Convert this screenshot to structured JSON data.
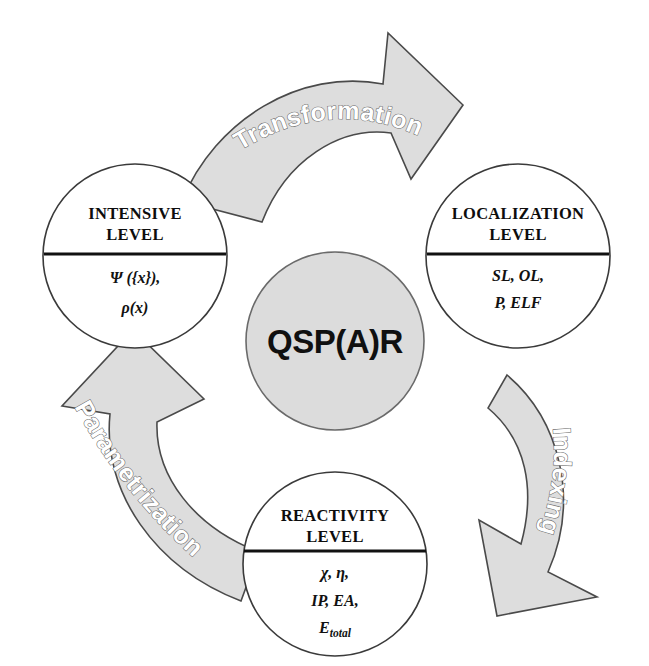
{
  "diagram": {
    "center": {
      "label": "QSP(A)R",
      "fill_color": "#dcdcdc",
      "stroke_color": "#6a6a6a"
    },
    "colors": {
      "arrow_fill": "#dddddd",
      "arrow_stroke": "#4a4a4a",
      "circle_fill": "#ffffff",
      "circle_stroke": "#3a3a3a",
      "text": "#101010",
      "label_outline": "#ffffff"
    },
    "nodes": [
      {
        "id": "intensive",
        "title_line1": "INTENSIVE",
        "title_line2": "LEVEL",
        "formula_lines": [
          "Ψ ({x}),",
          "ρ(x)"
        ]
      },
      {
        "id": "localization",
        "title_line1": "LOCALIZATION",
        "title_line2": "LEVEL",
        "formula_lines": [
          "SL, OL,",
          "P, ELF"
        ]
      },
      {
        "id": "reactivity",
        "title_line1": "REACTIVITY",
        "title_line2": "LEVEL",
        "formula_lines": [
          "χ, η,",
          "IP, EA,"
        ],
        "formula_sub_base": "E",
        "formula_sub_script": "total"
      }
    ],
    "arrows": [
      {
        "id": "transformation",
        "label": "Transformation",
        "from": "intensive",
        "to": "localization"
      },
      {
        "id": "indexing",
        "label": "Indexing",
        "from": "localization",
        "to": "reactivity"
      },
      {
        "id": "parametrization",
        "label": "Parametrization",
        "from": "reactivity",
        "to": "intensive"
      }
    ]
  }
}
